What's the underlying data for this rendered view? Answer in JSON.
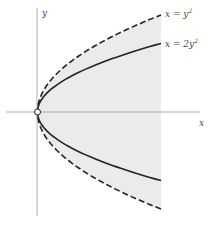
{
  "diagram": {
    "type": "region-plot",
    "axes": {
      "x_label": "x",
      "y_label": "y"
    },
    "curves": [
      {
        "name": "outer-parabola",
        "label": "x = y²",
        "label_text": "x = y",
        "label_sup": "2",
        "style": "dashed",
        "k": 1
      },
      {
        "name": "inner-parabola",
        "label": "x = 2y²",
        "label_text": "x = 2y",
        "label_sup": "2",
        "style": "solid",
        "k": 2
      }
    ],
    "region": {
      "description": "shaded region between axis-bounded parabola x = y² extending right",
      "fill": "#ebebeb"
    },
    "origin_marker": "open-circle",
    "x_range_shown": [
      0,
      1
    ]
  }
}
